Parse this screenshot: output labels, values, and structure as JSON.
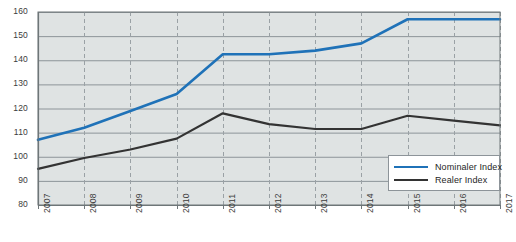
{
  "chart_data": {
    "type": "line",
    "title": "",
    "subtitle": "",
    "xlabel": "",
    "ylabel": "",
    "grid": true,
    "legend_position": "bottom-right",
    "ylim": [
      80,
      160
    ],
    "yticks": [
      80,
      90,
      100,
      110,
      120,
      130,
      140,
      150,
      160
    ],
    "ytick_labels": [
      "80",
      "90",
      "100",
      "110",
      "120",
      "130",
      "140",
      "150",
      "160"
    ],
    "categories": [
      "2007",
      "2008",
      "2009",
      "2010",
      "2011",
      "2012",
      "2013",
      "2014",
      "2015",
      "2016",
      "2017"
    ],
    "x": [
      2007,
      2008,
      2009,
      2010,
      2011,
      2012,
      2013,
      2014,
      2015,
      2016,
      2017
    ],
    "series": [
      {
        "name": "Nominaler Index",
        "color": "#1f72b8",
        "values": [
          107,
          112,
          119,
          126,
          142.5,
          142.5,
          144,
          147,
          157,
          157,
          157
        ]
      },
      {
        "name": "Realer Index",
        "color": "#333333",
        "values": [
          95,
          99.5,
          103,
          107.5,
          118,
          113.5,
          111.5,
          111.5,
          117,
          115,
          113
        ]
      }
    ]
  },
  "legend": {
    "items": [
      {
        "label": "Nominaler Index",
        "color": "#1f72b8"
      },
      {
        "label": "Realer Index",
        "color": "#333333"
      }
    ]
  },
  "colors": {
    "plot_background": "#dfe3e3",
    "gridline": "#8d9499",
    "vertical_gridline": "#9aa1a5",
    "axis": "#6f7679",
    "tick_text": "#3b3b3b",
    "nominal_series": "#1f72b8",
    "real_series": "#333333"
  }
}
